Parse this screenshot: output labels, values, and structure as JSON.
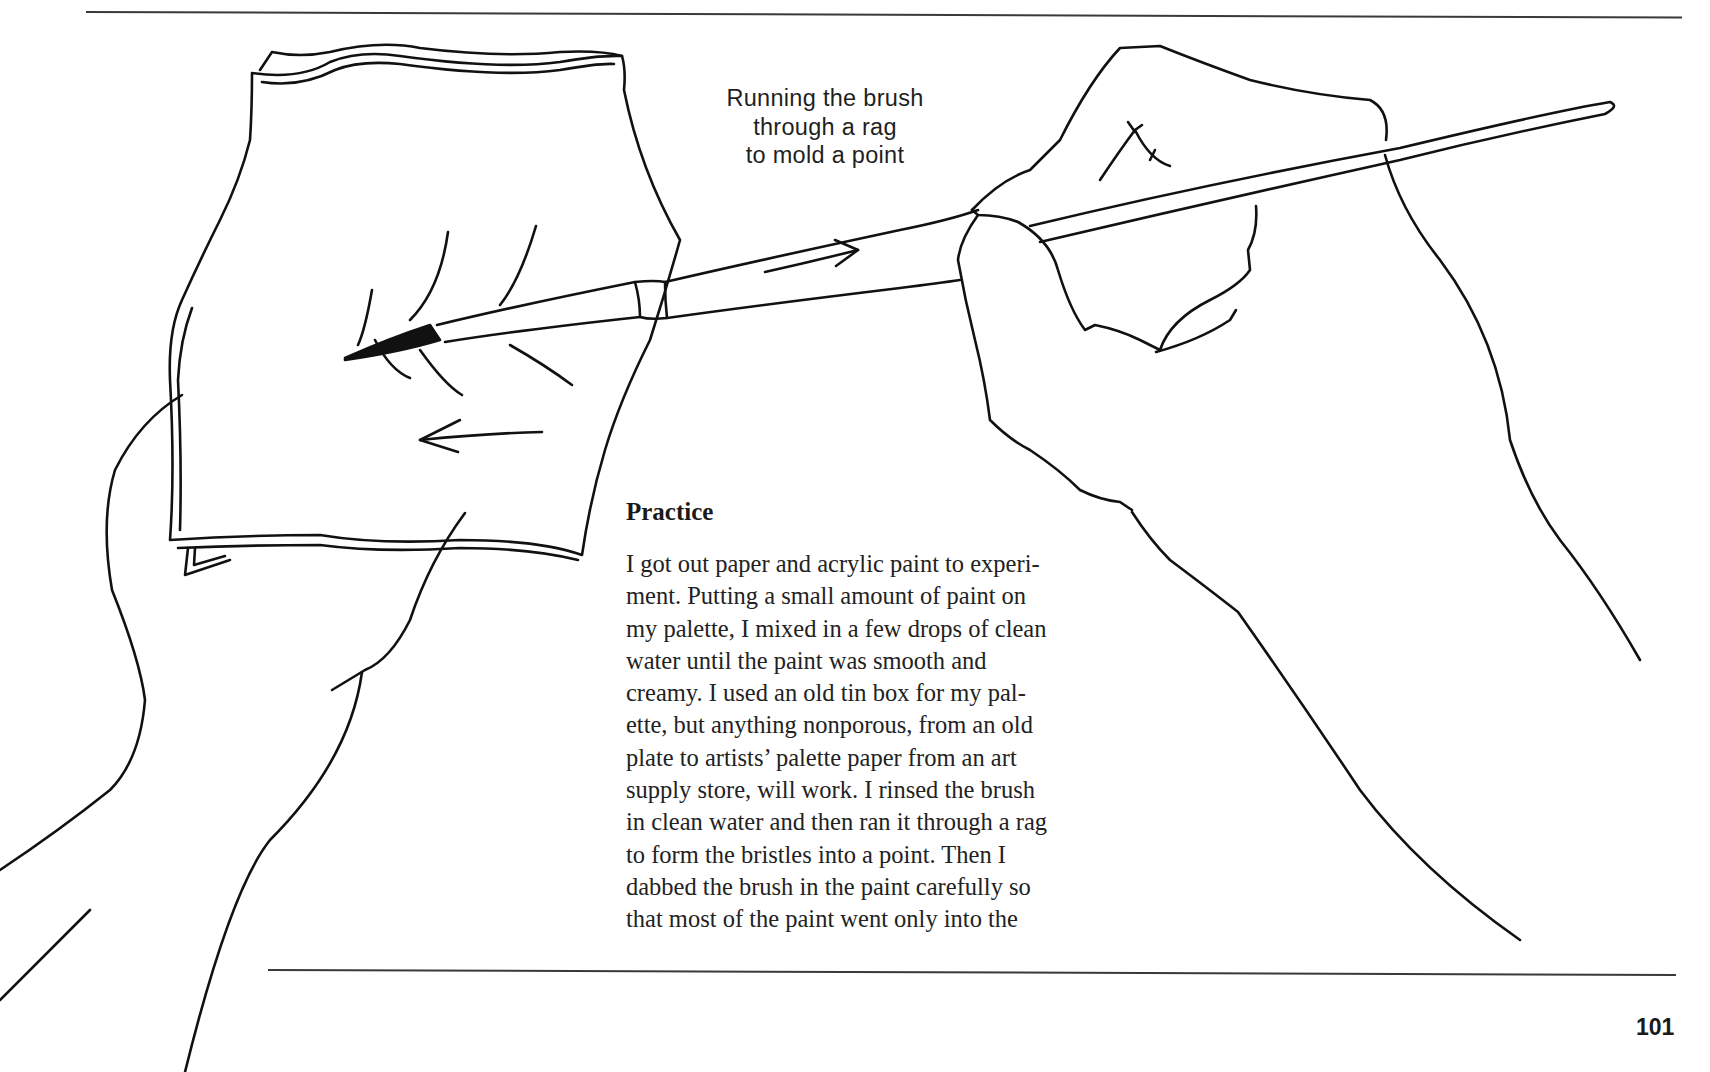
{
  "page": {
    "page_number": "101"
  },
  "illustration": {
    "caption_lines": [
      "Running the brush",
      "through a rag",
      "to mold a point"
    ],
    "depicts": [
      "left-hand-holding-rag",
      "right-hand-holding-brush",
      "brush",
      "motion-arrow-right",
      "motion-arrow-left"
    ]
  },
  "section": {
    "title": "Practice",
    "body_lines": [
      "I got out paper and acrylic paint to experi-",
      "ment. Putting a small amount of paint on",
      "my palette, I mixed in a few drops of clean",
      "water until the paint was smooth and",
      "creamy. I used an old tin box for my pal-",
      "ette, but anything nonporous, from an old",
      "plate to artists’ palette paper from an art",
      "supply store, will work. I rinsed the brush",
      "in clean water and then ran it through a rag",
      "to form the bristles into a point. Then I",
      "dabbed the brush in the paint carefully so",
      "that most of the paint went only into the"
    ]
  }
}
